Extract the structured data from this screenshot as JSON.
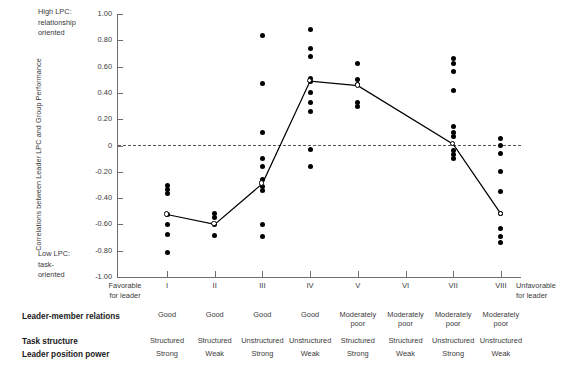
{
  "chart_data": {
    "type": "scatter",
    "title": "",
    "ylabel": "Correlations between Leader LPC and Group Performance",
    "xlabel": "",
    "ylim": [
      -1.0,
      1.0
    ],
    "grid": false,
    "legend": "none",
    "ytick_labels": [
      "1.00",
      "0.80",
      "0.60",
      "0.40",
      "0.20",
      "0",
      "-0.20",
      "-0.40",
      "-0.60",
      "-0.80",
      "-1.00"
    ],
    "ytick_values": [
      1.0,
      0.8,
      0.6,
      0.4,
      0.2,
      0.0,
      -0.2,
      -0.4,
      -0.6,
      -0.8,
      -1.0
    ],
    "categories": [
      "I",
      "II",
      "III",
      "IV",
      "V",
      "VI",
      "VII",
      "VIII"
    ],
    "zero_reference_line": 0,
    "annotations": {
      "top_left": "High LPC:\nrelationship\noriented",
      "bottom_left": "Low LPC:\ntask-\noriented",
      "axis_left_end": "Favorable\nfor leader",
      "axis_right_end": "Unfavorable\nfor leader"
    },
    "series": [
      {
        "name": "Median correlation",
        "marker": "open-circle",
        "line": true,
        "values": [
          -0.525,
          -0.6,
          -0.29,
          0.49,
          0.455,
          null,
          0.01,
          -0.52
        ]
      }
    ],
    "points_by_category": {
      "I": [
        -0.305,
        -0.335,
        -0.365,
        -0.525,
        -0.6,
        -0.68,
        -0.81
      ],
      "II": [
        -0.515,
        -0.545,
        -0.6,
        -0.685
      ],
      "III": [
        0.84,
        0.47,
        0.1,
        -0.1,
        -0.16,
        -0.26,
        -0.315,
        -0.345,
        -0.6,
        -0.695
      ],
      "IV": [
        0.88,
        0.74,
        0.68,
        0.51,
        0.485,
        0.4,
        0.33,
        0.26,
        -0.03,
        -0.16
      ],
      "V": [
        0.62,
        0.5,
        0.465,
        0.33,
        0.3
      ],
      "VI": [],
      "VII": [
        0.66,
        0.625,
        0.56,
        0.42,
        0.145,
        0.1,
        0.065,
        -0.035,
        -0.07,
        -0.1
      ],
      "VIII": [
        0.055,
        0.0,
        -0.06,
        -0.195,
        -0.35,
        -0.52,
        -0.63,
        -0.69,
        -0.74
      ]
    }
  },
  "axis": {
    "ytitle": "Correlations between Leader LPC and Group Performance",
    "high_lpc": [
      "High LPC:",
      "relationship",
      "oriented"
    ],
    "low_lpc": [
      "Low LPC:",
      "task-",
      "oriented"
    ],
    "favorable": [
      "Favorable",
      "for leader"
    ],
    "unfavorable": [
      "Unfavorable",
      "for leader"
    ]
  },
  "descriptor_table": {
    "row_labels": {
      "relations": "Leader-member relations",
      "task": "Task structure",
      "power": "Leader position power"
    },
    "columns": [
      {
        "roman": "I",
        "relations": "Good",
        "task": "Structured",
        "power": "Strong"
      },
      {
        "roman": "II",
        "relations": "Good",
        "task": "Structured",
        "power": "Weak"
      },
      {
        "roman": "III",
        "relations": "Good",
        "task": "Unstructured",
        "power": "Strong"
      },
      {
        "roman": "IV",
        "relations": "Good",
        "task": "Unstructured",
        "power": "Weak"
      },
      {
        "roman": "V",
        "relations": "Moderately poor",
        "task": "Structured",
        "power": "Strong"
      },
      {
        "roman": "VI",
        "relations": "Moderately poor",
        "task": "Structured",
        "power": "Weak"
      },
      {
        "roman": "VII",
        "relations": "Moderately poor",
        "task": "Unstructured",
        "power": "Strong"
      },
      {
        "roman": "VIII",
        "relations": "Moderately poor",
        "task": "Unstructured",
        "power": "Weak"
      }
    ]
  },
  "colors": {
    "ink": "#231f20",
    "axis": "#6d6d6d",
    "dot": "#000000",
    "dash": "#555555"
  }
}
